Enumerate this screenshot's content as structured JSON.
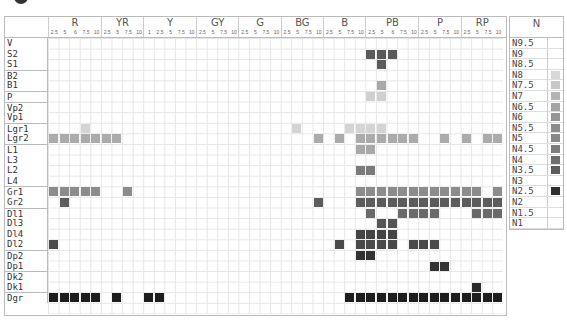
{
  "chart_data": {
    "type": "heatmap",
    "title": "",
    "hue_groups": [
      {
        "name": "R",
        "subs": [
          "2.5",
          "5",
          "6",
          "7.5",
          "10"
        ]
      },
      {
        "name": "YR",
        "subs": [
          "2.5",
          "5",
          "7.5",
          "10"
        ]
      },
      {
        "name": "Y",
        "subs": [
          "1",
          "2.5",
          "5",
          "7.5",
          "10"
        ]
      },
      {
        "name": "GY",
        "subs": [
          "2.5",
          "5",
          "7.5",
          "10"
        ]
      },
      {
        "name": "G",
        "subs": [
          "2.5",
          "5",
          "7.5",
          "10"
        ]
      },
      {
        "name": "BG",
        "subs": [
          "2.5",
          "5",
          "7.5",
          "10"
        ]
      },
      {
        "name": "B",
        "subs": [
          "2.5",
          "5",
          "7.5",
          "10"
        ]
      },
      {
        "name": "PB",
        "subs": [
          "2.5",
          "5",
          "6",
          "7.5",
          "10"
        ]
      },
      {
        "name": "P",
        "subs": [
          "2.5",
          "5",
          "7.5",
          "10"
        ]
      },
      {
        "name": "RP",
        "subs": [
          "2.5",
          "5",
          "7.5",
          "10"
        ]
      }
    ],
    "rows": [
      {
        "label": "V",
        "sep": false,
        "color": "#5a5a5a",
        "cells": []
      },
      {
        "label": "S2",
        "sep": false,
        "color": "#5a5a5a",
        "cells": [
          30,
          31,
          32
        ]
      },
      {
        "label": "S1",
        "sep": false,
        "color": "#5a5a5a",
        "cells": [
          31
        ]
      },
      {
        "label": "B2",
        "sep": true,
        "color": "#a8a8a8",
        "cells": []
      },
      {
        "label": "B1",
        "sep": false,
        "color": "#a8a8a8",
        "cells": [
          31
        ]
      },
      {
        "label": "P",
        "sep": true,
        "color": "#d0d0d0",
        "cells": [
          30,
          31
        ]
      },
      {
        "label": "Vp2",
        "sep": true,
        "color": "#d0d0d0",
        "cells": []
      },
      {
        "label": "Vp1",
        "sep": false,
        "color": "#d0d0d0",
        "cells": []
      },
      {
        "label": "Lgr1",
        "sep": true,
        "color": "#d4d4d4",
        "cells": [
          3,
          23,
          28,
          29,
          30,
          31
        ]
      },
      {
        "label": "Lgr2",
        "sep": false,
        "color": "#ababab",
        "cells": [
          0,
          1,
          2,
          3,
          4,
          5,
          6,
          25,
          27,
          29,
          30,
          31,
          32,
          33,
          34,
          37,
          39,
          41,
          42
        ]
      },
      {
        "label": "L1",
        "sep": true,
        "color": "#a8a8a8",
        "cells": [
          29,
          30
        ]
      },
      {
        "label": "L3",
        "sep": false,
        "color": "#a8a8a8",
        "cells": []
      },
      {
        "label": "L2",
        "sep": false,
        "color": "#7a7a7a",
        "cells": [
          29,
          30
        ]
      },
      {
        "label": "L4",
        "sep": false,
        "color": "#7a7a7a",
        "cells": []
      },
      {
        "label": "Gr1",
        "sep": true,
        "color": "#8c8c8c",
        "cells": [
          0,
          1,
          2,
          3,
          4,
          7,
          29,
          30,
          31,
          32,
          33,
          34,
          35,
          36,
          37,
          38,
          39,
          40,
          42
        ]
      },
      {
        "label": "Gr2",
        "sep": false,
        "color": "#5c5c5c",
        "cells": [
          1,
          25,
          29,
          30,
          31,
          32,
          33,
          34,
          35,
          36,
          37,
          38,
          39,
          40,
          41,
          42
        ]
      },
      {
        "label": "Dl1",
        "sep": true,
        "color": "#6a6a6a",
        "cells": [
          30,
          33,
          34,
          35,
          36,
          40,
          41,
          42
        ]
      },
      {
        "label": "Dl3",
        "sep": false,
        "color": "#555555",
        "cells": [
          31,
          32
        ]
      },
      {
        "label": "Dl4",
        "sep": false,
        "color": "#444444",
        "cells": [
          29,
          30,
          31,
          32
        ]
      },
      {
        "label": "Dl2",
        "sep": false,
        "color": "#4a4a4a",
        "cells": [
          0,
          27,
          29,
          30,
          31,
          32,
          34,
          35,
          36
        ]
      },
      {
        "label": "Dp2",
        "sep": true,
        "color": "#333333",
        "cells": [
          29,
          30
        ]
      },
      {
        "label": "Dp1",
        "sep": false,
        "color": "#333333",
        "cells": [
          36,
          37
        ]
      },
      {
        "label": "Dk2",
        "sep": true,
        "color": "#2a2a2a",
        "cells": []
      },
      {
        "label": "Dk1",
        "sep": false,
        "color": "#2a2a2a",
        "cells": [
          40
        ]
      },
      {
        "label": "Dgr",
        "sep": true,
        "color": "#1e1e1e",
        "cells": [
          0,
          1,
          2,
          3,
          4,
          6,
          9,
          10,
          28,
          29,
          30,
          31,
          32,
          33,
          34,
          35,
          36,
          37,
          38,
          39,
          40,
          41,
          42
        ]
      }
    ],
    "neutral_scale": {
      "title": "N",
      "items": [
        {
          "label": "N9.5",
          "color": ""
        },
        {
          "label": "N9",
          "color": ""
        },
        {
          "label": "N8.5",
          "color": ""
        },
        {
          "label": "N8",
          "color": "#d8d8d8"
        },
        {
          "label": "N7.5",
          "color": "#c8c8c8"
        },
        {
          "label": "N7",
          "color": "#b4b4b4"
        },
        {
          "label": "N6.5",
          "color": "#a4a4a4"
        },
        {
          "label": "N6",
          "color": "#969696"
        },
        {
          "label": "N5.5",
          "color": "#8c8c8c"
        },
        {
          "label": "N5",
          "color": "#888888"
        },
        {
          "label": "N4.5",
          "color": "#7c7c7c"
        },
        {
          "label": "N4",
          "color": "#6c6c6c"
        },
        {
          "label": "N3.5",
          "color": "#5c5c5c"
        },
        {
          "label": "N3",
          "color": ""
        },
        {
          "label": "N2.5",
          "color": "#2e2e2e"
        },
        {
          "label": "N2",
          "color": ""
        },
        {
          "label": "N1.5",
          "color": ""
        },
        {
          "label": "N1",
          "color": ""
        }
      ]
    },
    "grid": true
  }
}
